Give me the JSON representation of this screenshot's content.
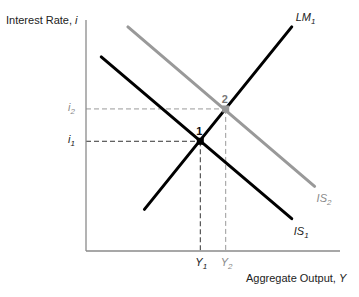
{
  "chart_data": {
    "type": "line",
    "title": "",
    "xlabel": "Aggregate Output, Y",
    "ylabel": "Interest Rate, i",
    "series": [
      {
        "name": "LM1",
        "label_main": "LM",
        "label_sub": "1",
        "color": "#000000",
        "from": [
          0.23,
          0.18
        ],
        "to": [
          0.81,
          0.97
        ]
      },
      {
        "name": "IS1",
        "label_main": "IS",
        "label_sub": "1",
        "color": "#000000",
        "from": [
          0.06,
          0.84
        ],
        "to": [
          0.81,
          0.14
        ]
      },
      {
        "name": "IS2",
        "label_main": "IS",
        "label_sub": "2",
        "color": "#999999",
        "from": [
          0.165,
          0.97
        ],
        "to": [
          0.9,
          0.28
        ]
      }
    ],
    "equilibria": [
      {
        "label": "1",
        "x": 0.45,
        "y": 0.475,
        "color": "#000000",
        "x_tick_main": "Y",
        "x_tick_sub": "1",
        "y_tick_main": "i",
        "y_tick_sub": "1"
      },
      {
        "label": "2",
        "x": 0.55,
        "y": 0.615,
        "color": "#999999",
        "x_tick_main": "Y",
        "x_tick_sub": "2",
        "y_tick_main": "i",
        "y_tick_sub": "2"
      }
    ],
    "xlim": [
      0,
      1
    ],
    "ylim": [
      0,
      1
    ],
    "grid": false,
    "legend": "none"
  },
  "axes": {
    "y_label_main": "Interest Rate, ",
    "y_label_var": "i",
    "x_label_main": "Aggregate Output, ",
    "x_label_var": "Y"
  }
}
